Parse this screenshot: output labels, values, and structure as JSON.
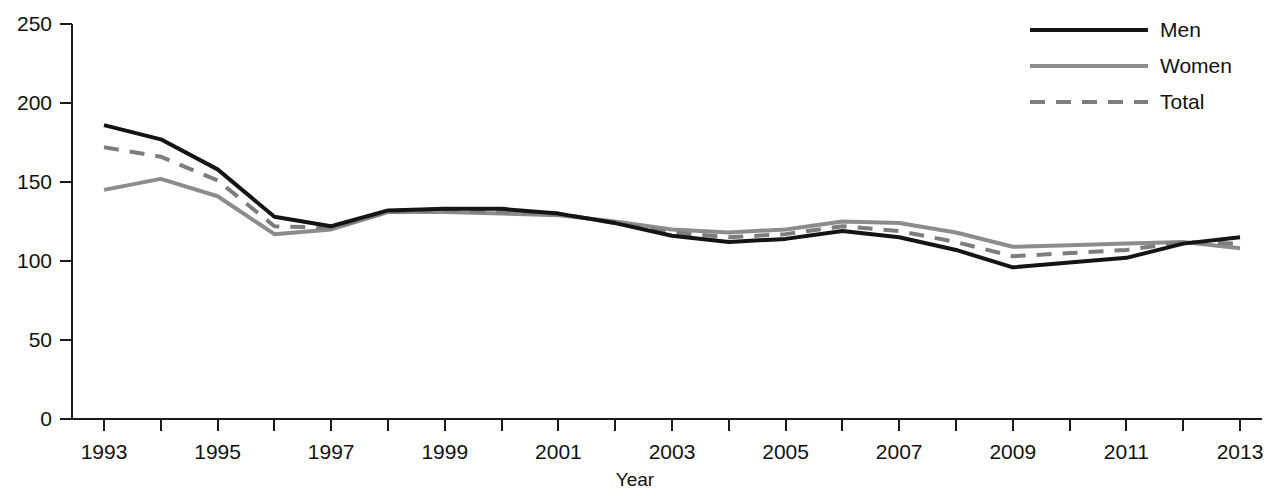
{
  "chart_data": {
    "type": "line",
    "title": "",
    "xlabel": "Year",
    "ylabel": "",
    "xlim": [
      1993,
      2013
    ],
    "ylim": [
      0,
      250
    ],
    "grid": false,
    "legend_position": "top-right",
    "x": [
      1993,
      1994,
      1995,
      1996,
      1997,
      1998,
      1999,
      2000,
      2001,
      2002,
      2003,
      2004,
      2005,
      2006,
      2007,
      2008,
      2009,
      2010,
      2011,
      2012,
      2013
    ],
    "xtick_labels": [
      "1993",
      "1995",
      "1997",
      "1999",
      "2001",
      "2003",
      "2005",
      "2007",
      "2009",
      "2011",
      "2013"
    ],
    "xtick_values": [
      1993,
      1995,
      1997,
      1999,
      2001,
      2003,
      2005,
      2007,
      2009,
      2011,
      2013
    ],
    "xtick_minor_values": [
      1994,
      1996,
      1998,
      2000,
      2002,
      2004,
      2006,
      2008,
      2010,
      2012
    ],
    "ytick_labels": [
      "0",
      "50",
      "100",
      "150",
      "200",
      "250"
    ],
    "ytick_values": [
      0,
      50,
      100,
      150,
      200,
      250
    ],
    "series": [
      {
        "name": "Men",
        "color": "#141414",
        "style": "solid",
        "width": 4,
        "values": [
          186,
          177,
          158,
          128,
          122,
          132,
          133,
          133,
          130,
          124,
          116,
          112,
          114,
          119,
          115,
          107,
          96,
          99,
          102,
          111,
          115
        ]
      },
      {
        "name": "Women",
        "color": "#8c8c8c",
        "style": "solid",
        "width": 4,
        "values": [
          145,
          152,
          141,
          117,
          120,
          131,
          131,
          130,
          129,
          125,
          120,
          118,
          120,
          125,
          124,
          118,
          109,
          110,
          111,
          112,
          108
        ]
      },
      {
        "name": "Total",
        "color": "#7d7d7d",
        "style": "dashed",
        "width": 4,
        "values": [
          172,
          166,
          151,
          122,
          121,
          131,
          132,
          131,
          130,
          124,
          118,
          115,
          117,
          122,
          119,
          112,
          103,
          105,
          107,
          112,
          111
        ]
      }
    ]
  },
  "legend": {
    "items": [
      {
        "label": "Men"
      },
      {
        "label": "Women"
      },
      {
        "label": "Total"
      }
    ]
  }
}
